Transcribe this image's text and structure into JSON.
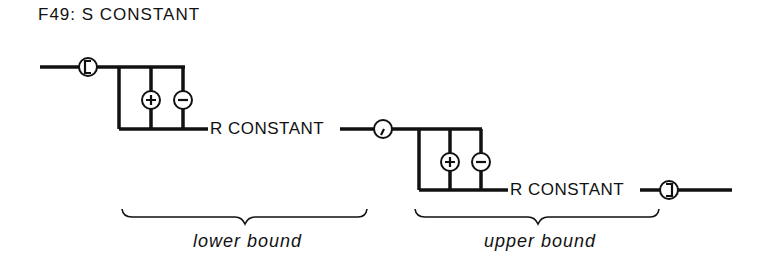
{
  "title": "F49: S CONSTANT",
  "diagram": {
    "type": "railroad-syntax-diagram",
    "start_symbol": "[",
    "separator_symbol": ",",
    "end_symbol": "]",
    "first_group": {
      "sign_options": [
        "+",
        "-"
      ],
      "term": "R CONSTANT",
      "brace_label": "lower bound"
    },
    "second_group": {
      "sign_options": [
        "+",
        "-"
      ],
      "term": "R CONSTANT",
      "brace_label": "upper bound"
    }
  }
}
